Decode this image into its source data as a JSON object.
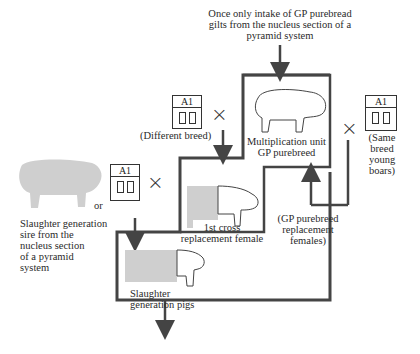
{
  "top_note": [
    "Once only intake of GP purebread",
    "gilts from the nucleus section of a",
    "pyramid system"
  ],
  "multiplication": {
    "line1": "Multiplication unit",
    "line2": "GP purebreed"
  },
  "ai_labels": {
    "a": "A1",
    "b": "A1",
    "c": "A1"
  },
  "different_breed": "(Different breed)",
  "same_breed": [
    "(Same",
    "breed",
    "young",
    "boars)"
  ],
  "first_cross": {
    "line1": "1st cross",
    "line2": "replacement female"
  },
  "gp_replacement": [
    "(GP purebreed",
    "replacement",
    "females)"
  ],
  "or_label": "or",
  "slaughter_sire": [
    "Slaughter generation",
    "sire from the",
    "nucleus section",
    "of a pyramid",
    "system"
  ],
  "slaughter_pigs": {
    "line1": "Slaughter",
    "line2": "generation pigs"
  },
  "cross_symbol": "×",
  "colors": {
    "line": "#444444",
    "pig_gray": "#cfcfcf"
  }
}
